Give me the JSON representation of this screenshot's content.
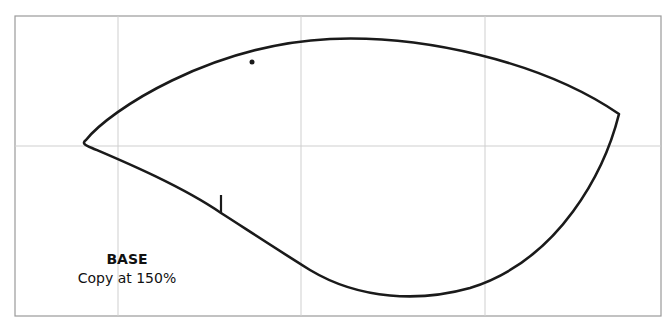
{
  "pattern": {
    "piece_name": "BASE",
    "instruction": "Copy at 150%"
  },
  "colors": {
    "background": "#ffffff",
    "frame": "#9a9a9a",
    "grid": "#cfcfcf",
    "outline": "#1a1a1a"
  },
  "grid": {
    "frame": {
      "x": 15,
      "y": 16,
      "width": 646,
      "height": 300
    },
    "vertical_lines_x": [
      118,
      301,
      485
    ],
    "horizontal_lines_y": [
      146
    ]
  },
  "shape": {
    "path": "M 86 140 C 110 110, 210 45, 330 39 C 420 35, 540 60, 619 114 C 605 170, 560 260, 470 288 C 420 302, 360 300, 310 270 C 270 245, 240 225, 221 213 C 180 185, 120 160, 92 148 C 84 145, 82 143, 86 140 Z",
    "left_tip": [
      86,
      140
    ],
    "right_tip": [
      619,
      114
    ],
    "top_peak": [
      375,
      38
    ],
    "bottom_trough": [
      395,
      295
    ]
  },
  "markers": {
    "dot": {
      "x": 252,
      "y": 62,
      "r": 2.5
    },
    "notch": {
      "x": 221,
      "y1": 195,
      "y2": 213
    }
  }
}
